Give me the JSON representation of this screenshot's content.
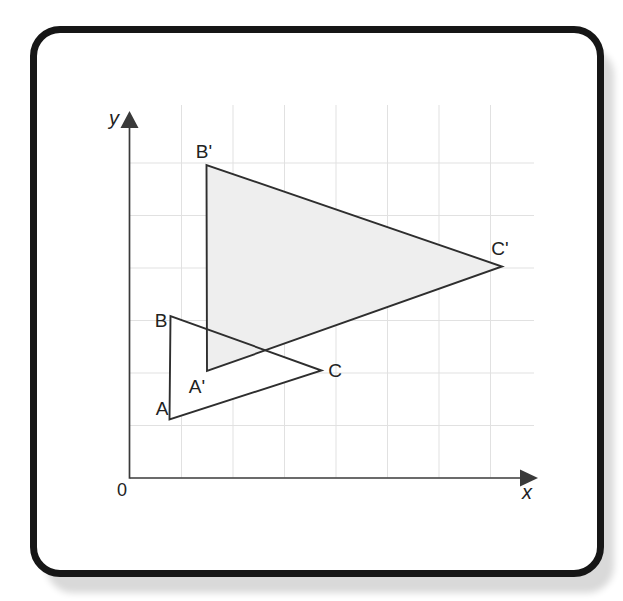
{
  "figure": {
    "canvas": {
      "width": 623,
      "height": 601,
      "background": "#ffffff"
    },
    "frame": {
      "border_color": "#161616",
      "shadow_color": "#d9d9d9"
    },
    "colors": {
      "grid": "#e1e1e1",
      "axis": "#3a3a3a",
      "triangle_stroke": "#2e2e2e",
      "image_fill": "#eeeeee",
      "preimage_fill": "#ffffff",
      "label": "#222222"
    },
    "grid": {
      "vertical_x": [
        181.5,
        233,
        284.5,
        336,
        387.5,
        439,
        490.5
      ],
      "vertical_y1": 105,
      "vertical_y2": 477.5,
      "horizontal_y": [
        163,
        215.5,
        268,
        320.5,
        373,
        425.5
      ],
      "horizontal_x1": 130,
      "horizontal_x2": 534
    },
    "axes": {
      "origin": {
        "x": 130,
        "y": 478
      },
      "x_axis": {
        "label": "x",
        "line_end": 521,
        "tip": 538,
        "label_x": 527,
        "label_y": 499
      },
      "y_axis": {
        "label": "y",
        "line_end": 127,
        "tip": 111,
        "label_x": 114,
        "label_y": 125
      },
      "origin_label": {
        "text": "0",
        "x": 122,
        "y": 496
      }
    },
    "triangles": {
      "preimage": {
        "name": "ABC",
        "points": [
          [
            169.5,
            419.5
          ],
          [
            170.5,
            316
          ],
          [
            321.5,
            370.5
          ]
        ]
      },
      "image": {
        "name": "A'B'C'",
        "points": [
          [
            207,
            371
          ],
          [
            206.5,
            165
          ],
          [
            502,
            266.5
          ]
        ]
      }
    },
    "vertex_labels": [
      {
        "text": "A",
        "x": 162,
        "y": 415
      },
      {
        "text": "B",
        "x": 161,
        "y": 327
      },
      {
        "text": "C",
        "x": 335,
        "y": 377
      },
      {
        "text": "A'",
        "x": 197,
        "y": 393
      },
      {
        "text": "B'",
        "x": 204,
        "y": 158
      },
      {
        "text": "C'",
        "x": 500,
        "y": 255
      }
    ]
  }
}
